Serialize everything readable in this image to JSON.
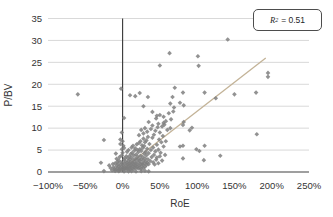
{
  "chart_data": {
    "type": "scatter",
    "title": "",
    "xlabel": "RoE",
    "ylabel": "P/BV",
    "xlim": [
      -100,
      250
    ],
    "ylim": [
      0,
      35
    ],
    "x_tick_values": [
      -100,
      -50,
      0,
      50,
      100,
      150,
      200,
      250
    ],
    "x_tick_labels": [
      "−100%",
      "−50%",
      "0%",
      "50%",
      "100%",
      "150%",
      "200%",
      "250%"
    ],
    "y_tick_values": [
      0,
      5,
      10,
      15,
      20,
      25,
      30,
      35
    ],
    "grid": "horizontal",
    "legend_position": "top-right",
    "annotation": "R² = 0.51",
    "r_squared": 0.51,
    "trendline": {
      "x1": -5,
      "y1": 0,
      "x2": 192,
      "y2": 26
    },
    "colors": {
      "point": "#7f7f7f",
      "trendline": "#c3b397",
      "gridline": "#d9d9d9",
      "axis": "#404040",
      "tick_text": "#333333"
    },
    "series_name": "P/BV vs RoE (% RoE, x P/BV)",
    "points": [
      [
        -60,
        17.7
      ],
      [
        -25,
        7.3
      ],
      [
        -29,
        2.1
      ],
      [
        -25,
        0.2
      ],
      [
        -2,
        19.0
      ],
      [
        10,
        17.5
      ],
      [
        17,
        17.3
      ],
      [
        63,
        27.1
      ],
      [
        101,
        26.4
      ],
      [
        102,
        24.2
      ],
      [
        50,
        24.3
      ],
      [
        141,
        30.2
      ],
      [
        195,
        22.6
      ],
      [
        195,
        21.7
      ],
      [
        179,
        18.1
      ],
      [
        180,
        8.6
      ],
      [
        150,
        17.7
      ],
      [
        70,
        19.2
      ],
      [
        81,
        18.1
      ],
      [
        110,
        18.1
      ],
      [
        125,
        16.8
      ],
      [
        67,
        17.1
      ],
      [
        77,
        15.8
      ],
      [
        82,
        15.2
      ],
      [
        64,
        15.6
      ],
      [
        69,
        14.7
      ],
      [
        40,
        13.7
      ],
      [
        46,
        12.8
      ],
      [
        55,
        11.2
      ],
      [
        81,
        10.7
      ],
      [
        90,
        9.5
      ],
      [
        82,
        11.4
      ],
      [
        93,
        10.1
      ],
      [
        110,
        6.0
      ],
      [
        77,
        5.8
      ],
      [
        103,
        4.8
      ],
      [
        99,
        5.2
      ],
      [
        81,
        3.1
      ],
      [
        109,
        2.7
      ],
      [
        131,
        3.7
      ],
      [
        81,
        6.0
      ],
      [
        2,
        12.3
      ],
      [
        -1,
        9.0
      ],
      [
        -3,
        7.4
      ],
      [
        28,
        15.0
      ],
      [
        34,
        17.1
      ],
      [
        23,
        18.0
      ],
      [
        -14,
        0.4
      ],
      [
        -12,
        1.1
      ],
      [
        -11,
        0.7
      ],
      [
        -10,
        2.0
      ],
      [
        -9,
        0.5
      ],
      [
        -8,
        1.4
      ],
      [
        -8,
        3.0
      ],
      [
        -7,
        0.9
      ],
      [
        -6,
        1.8
      ],
      [
        -6,
        0.4
      ],
      [
        -5,
        2.6
      ],
      [
        -5,
        1.2
      ],
      [
        -4,
        0.6
      ],
      [
        -4,
        3.4
      ],
      [
        -3,
        1.6
      ],
      [
        -3,
        0.9
      ],
      [
        -2,
        2.2
      ],
      [
        -2,
        0.5
      ],
      [
        -1,
        1.3
      ],
      [
        -1,
        3.8
      ],
      [
        0,
        0.8
      ],
      [
        0,
        2.0
      ],
      [
        0,
        4.4
      ],
      [
        1,
        1.5
      ],
      [
        1,
        0.6
      ],
      [
        2,
        2.8
      ],
      [
        2,
        1.0
      ],
      [
        3,
        0.7
      ],
      [
        3,
        3.2
      ],
      [
        3,
        1.9
      ],
      [
        4,
        0.9
      ],
      [
        4,
        2.4
      ],
      [
        5,
        1.4
      ],
      [
        5,
        0.6
      ],
      [
        5,
        3.6
      ],
      [
        -9,
        4.2
      ],
      [
        -7,
        2.3
      ],
      [
        -13,
        1.8
      ],
      [
        -16,
        0.9
      ],
      [
        -18,
        1.5
      ],
      [
        6,
        1.0
      ],
      [
        6,
        2.1
      ],
      [
        6,
        4.6
      ],
      [
        7,
        0.7
      ],
      [
        7,
        1.7
      ],
      [
        7,
        3.1
      ],
      [
        8,
        1.2
      ],
      [
        8,
        2.5
      ],
      [
        8,
        5.0
      ],
      [
        9,
        0.9
      ],
      [
        9,
        1.9
      ],
      [
        9,
        3.6
      ],
      [
        10,
        1.4
      ],
      [
        10,
        2.9
      ],
      [
        10,
        0.5
      ],
      [
        11,
        2.2
      ],
      [
        11,
        4.1
      ],
      [
        11,
        1.0
      ],
      [
        12,
        1.6
      ],
      [
        12,
        3.3
      ],
      [
        12,
        5.6
      ],
      [
        13,
        0.8
      ],
      [
        13,
        2.0
      ],
      [
        13,
        4.4
      ],
      [
        14,
        1.3
      ],
      [
        14,
        2.7
      ],
      [
        14,
        6.0
      ],
      [
        15,
        1.8
      ],
      [
        15,
        3.8
      ],
      [
        15,
        0.6
      ],
      [
        16,
        2.3
      ],
      [
        16,
        4.9
      ],
      [
        16,
        1.1
      ],
      [
        17,
        1.5
      ],
      [
        17,
        3.0
      ],
      [
        17,
        5.4
      ],
      [
        18,
        2.0
      ],
      [
        18,
        0.9
      ],
      [
        18,
        4.0
      ],
      [
        19,
        1.6
      ],
      [
        19,
        2.8
      ],
      [
        19,
        6.3
      ],
      [
        20,
        1.2
      ],
      [
        20,
        3.5
      ],
      [
        20,
        5.0
      ],
      [
        21,
        2.2
      ],
      [
        21,
        4.5
      ],
      [
        21,
        0.8
      ],
      [
        22,
        3.0
      ],
      [
        22,
        1.5
      ],
      [
        22,
        6.6
      ],
      [
        23,
        2.5
      ],
      [
        23,
        5.2
      ],
      [
        23,
        1.0
      ],
      [
        24,
        3.7
      ],
      [
        24,
        1.8
      ],
      [
        24,
        7.0
      ],
      [
        25,
        2.9
      ],
      [
        25,
        0.7
      ],
      [
        25,
        4.8
      ],
      [
        26,
        2.0
      ],
      [
        26,
        6.1
      ],
      [
        26,
        1.3
      ],
      [
        27,
        3.4
      ],
      [
        27,
        5.5
      ],
      [
        27,
        1.7
      ],
      [
        28,
        2.6
      ],
      [
        28,
        7.6
      ],
      [
        28,
        0.9
      ],
      [
        29,
        4.2
      ],
      [
        29,
        1.9
      ],
      [
        29,
        5.9
      ],
      [
        30,
        3.1
      ],
      [
        30,
        1.2
      ],
      [
        30,
        6.8
      ],
      [
        31,
        2.4
      ],
      [
        31,
        4.6
      ],
      [
        32,
        1.6
      ],
      [
        32,
        7.2
      ],
      [
        32,
        3.8
      ],
      [
        33,
        2.1
      ],
      [
        33,
        5.3
      ],
      [
        34,
        2.9
      ],
      [
        34,
        8.0
      ],
      [
        35,
        1.8
      ],
      [
        35,
        4.3
      ],
      [
        36,
        6.4
      ],
      [
        37,
        2.5
      ],
      [
        38,
        5.0
      ],
      [
        39,
        3.4
      ],
      [
        40,
        7.8
      ],
      [
        41,
        2.2
      ],
      [
        41,
        5.6
      ],
      [
        42,
        3.9
      ],
      [
        42,
        8.5
      ],
      [
        43,
        1.7
      ],
      [
        44,
        4.7
      ],
      [
        44,
        9.4
      ],
      [
        45,
        2.8
      ],
      [
        46,
        6.2
      ],
      [
        46,
        3.3
      ],
      [
        47,
        10.2
      ],
      [
        48,
        2.0
      ],
      [
        48,
        5.1
      ],
      [
        49,
        7.4
      ],
      [
        50,
        3.6
      ],
      [
        50,
        9.0
      ],
      [
        51,
        4.4
      ],
      [
        52,
        6.8
      ],
      [
        53,
        2.6
      ],
      [
        54,
        8.2
      ],
      [
        55,
        5.8
      ],
      [
        56,
        10.8
      ],
      [
        57,
        3.9
      ],
      [
        58,
        7.0
      ],
      [
        60,
        9.6
      ],
      [
        45,
        12.2
      ],
      [
        48,
        11.0
      ],
      [
        50,
        13.0
      ],
      [
        53,
        10.4
      ],
      [
        55,
        12.6
      ],
      [
        58,
        11.6
      ],
      [
        62,
        13.4
      ],
      [
        64,
        10.0
      ],
      [
        65,
        12.0
      ],
      [
        68,
        13.8
      ],
      [
        40,
        10.6
      ],
      [
        38,
        9.8
      ],
      [
        35,
        11.4
      ],
      [
        33,
        9.2
      ],
      [
        30,
        10.0
      ],
      [
        28,
        8.8
      ],
      [
        25,
        9.6
      ],
      [
        22,
        8.4
      ],
      [
        -1,
        5.2
      ],
      [
        1,
        6.0
      ],
      [
        2,
        5.5
      ],
      [
        -3,
        6.4
      ],
      [
        0,
        7.0
      ],
      [
        8,
        0.15
      ],
      [
        12,
        0.2
      ],
      [
        18,
        0.1
      ],
      [
        25,
        0.2
      ],
      [
        2,
        0.1
      ],
      [
        -5,
        0.2
      ],
      [
        30,
        0.3
      ],
      [
        35,
        0.15
      ],
      [
        -10,
        0.25
      ]
    ]
  },
  "legend": {
    "r_label": "R",
    "r_exponent": "2",
    "value_text": "= 0.51"
  }
}
